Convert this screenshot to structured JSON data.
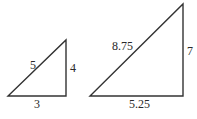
{
  "diagram": {
    "colors": {
      "stroke": "#333333",
      "text": "#2a2a2a",
      "background": "#ffffff"
    },
    "triangles": [
      {
        "name": "small-triangle",
        "hypotenuse": "5",
        "height": "4",
        "base": "3",
        "vertices": {
          "bottom_left": [
            8,
            96
          ],
          "bottom_right": [
            66,
            96
          ],
          "top": [
            66,
            40
          ]
        }
      },
      {
        "name": "large-triangle",
        "hypotenuse": "8.75",
        "height": "7",
        "base": "5.25",
        "vertices": {
          "bottom_left": [
            90,
            96
          ],
          "bottom_right": [
            183,
            96
          ],
          "top": [
            183,
            4
          ]
        }
      }
    ]
  }
}
